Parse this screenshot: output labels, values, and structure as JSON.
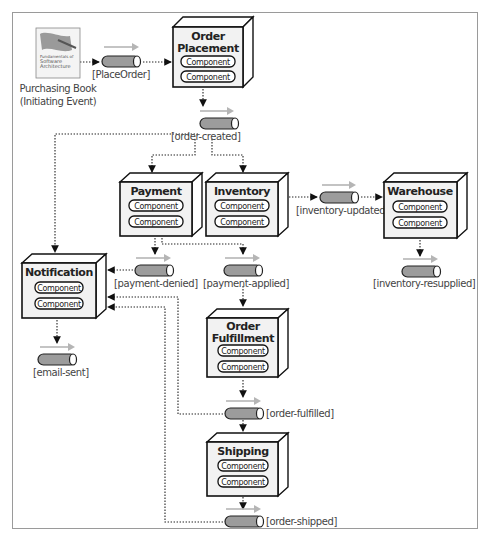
{
  "diagram": {
    "initiating_event": {
      "book_cover_line1": "Fundamentals of",
      "book_cover_line2": "Software",
      "book_cover_line3": "Architecture",
      "label_line1": "Purchasing Book",
      "label_line2": "(Initiating Event)"
    },
    "processors": {
      "order_placement": {
        "title_line1": "Order",
        "title_line2": "Placement",
        "components": [
          "Component",
          "Component"
        ]
      },
      "payment": {
        "title_line1": "Payment",
        "components": [
          "Component",
          "Component"
        ]
      },
      "inventory": {
        "title_line1": "Inventory",
        "components": [
          "Component",
          "Component"
        ]
      },
      "warehouse": {
        "title_line1": "Warehouse",
        "components": [
          "Component",
          "Component"
        ]
      },
      "notification": {
        "title_line1": "Notification",
        "components": [
          "Component",
          "Component"
        ]
      },
      "order_fulfillment": {
        "title_line1": "Order",
        "title_line2": "Fulfillment",
        "components": [
          "Component",
          "Component"
        ]
      },
      "shipping": {
        "title_line1": "Shipping",
        "components": [
          "Component",
          "Component"
        ]
      }
    },
    "events": {
      "place_order": "[PlaceOrder]",
      "order_created": "[order-created]",
      "inventory_updated": "[inventory-updated]",
      "inventory_resupplied": "[inventory-resupplied]",
      "payment_denied": "[payment-denied]",
      "payment_applied": "[payment-applied]",
      "email_sent": "[email-sent]",
      "order_fulfilled": "[order-fulfilled]",
      "order_shipped": "[order-shipped]"
    },
    "colors": {
      "frame": "#9a9a9a",
      "box_front": "#f2f2f2",
      "queue_fill": "#9c9c9c",
      "queue_arrow": "#b5b5b5",
      "line": "#222222"
    }
  }
}
